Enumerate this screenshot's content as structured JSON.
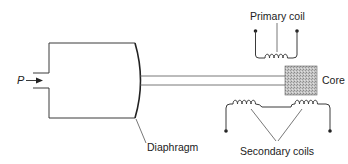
{
  "diagram": {
    "type": "LVDT pressure transducer schematic",
    "labels": {
      "pressure": "P",
      "diaphragm": "Diaphragm",
      "primary_coil": "Primary coil",
      "core": "Core",
      "secondary_coils": "Secondary coils"
    },
    "nodes": [
      {
        "id": "pressure-inlet",
        "label": "P"
      },
      {
        "id": "chamber",
        "label": ""
      },
      {
        "id": "diaphragm",
        "label": "Diaphragm"
      },
      {
        "id": "rod",
        "label": ""
      },
      {
        "id": "core",
        "label": "Core"
      },
      {
        "id": "primary-coil",
        "label": "Primary coil"
      },
      {
        "id": "secondary-coil-left",
        "label": "Secondary coils"
      },
      {
        "id": "secondary-coil-right",
        "label": "Secondary coils"
      }
    ],
    "edges": [
      {
        "from": "pressure-inlet",
        "to": "chamber"
      },
      {
        "from": "chamber",
        "to": "diaphragm"
      },
      {
        "from": "diaphragm",
        "to": "rod"
      },
      {
        "from": "rod",
        "to": "core"
      },
      {
        "from": "primary-coil",
        "to": "core"
      },
      {
        "from": "core",
        "to": "secondary-coil-left"
      },
      {
        "from": "core",
        "to": "secondary-coil-right"
      }
    ],
    "colors": {
      "line": "#3a3a3a",
      "core_fill": "#b8b8b8",
      "text": "#222222",
      "background": "#ffffff"
    }
  }
}
